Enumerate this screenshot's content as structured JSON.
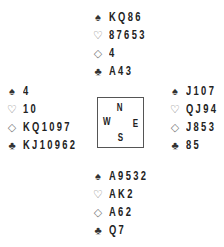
{
  "suits": {
    "spades": "♠",
    "hearts": "♡",
    "diamonds": "◇",
    "clubs": "♣"
  },
  "compass": {
    "north": "N",
    "west": "W",
    "east": "E",
    "south": "S"
  },
  "hands": {
    "north": {
      "spades": "KQ86",
      "hearts": "87653",
      "diamonds": "4",
      "clubs": "A43"
    },
    "west": {
      "spades": "4",
      "hearts": "10",
      "diamonds": "KQ1097",
      "clubs": "KJ10962"
    },
    "east": {
      "spades": "J107",
      "hearts": "QJ94",
      "diamonds": "J853",
      "clubs": "85"
    },
    "south": {
      "spades": "A9532",
      "hearts": "AK2",
      "diamonds": "A62",
      "clubs": "Q7"
    }
  }
}
